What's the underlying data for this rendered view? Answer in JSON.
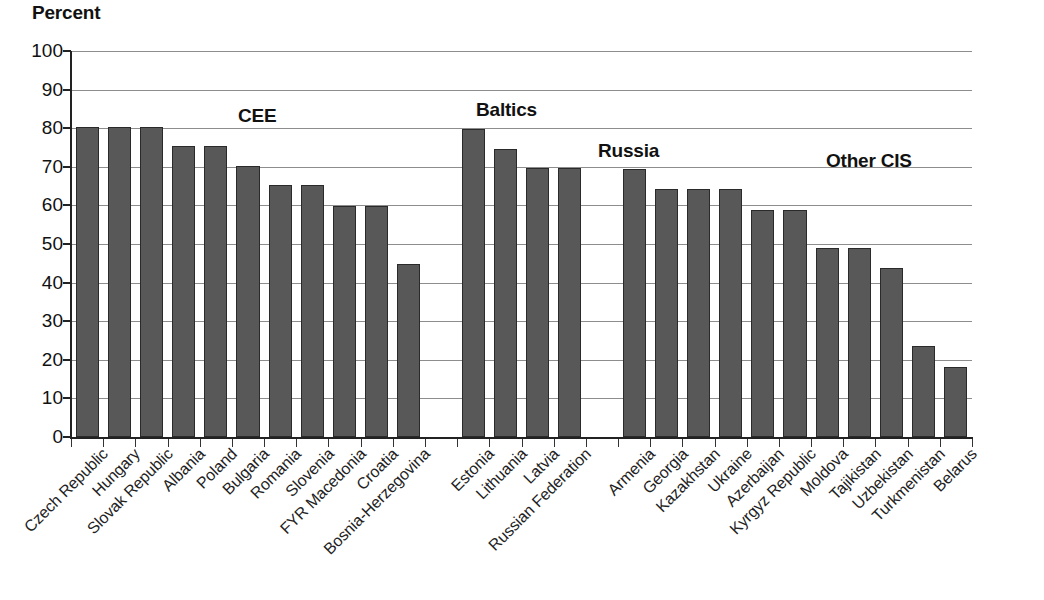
{
  "chart_data": {
    "type": "bar",
    "title": "",
    "ylabel": "Percent",
    "xlabel": "",
    "ylim": [
      0,
      100
    ],
    "ytick_step": 10,
    "yticks": [
      0,
      10,
      20,
      30,
      40,
      50,
      60,
      70,
      80,
      90,
      100
    ],
    "grid": true,
    "legend": "none",
    "bar_color": "#585858",
    "bar_edge_color": "#2a2a2a",
    "gridline_color": "#8d8d8d",
    "axis_color": "#222222",
    "categories": [
      "Czech Republic",
      "Hungary",
      "Slovak Republic",
      "Albania",
      "Poland",
      "Bulgaria",
      "Romania",
      "Slovenia",
      "FYR Macedonia",
      "Croatia",
      "Bosnia-Herzegovina",
      "Estonia",
      "Lithuania",
      "Latvia",
      "Russian Federation",
      "Armenia",
      "Georgia",
      "Kazakhstan",
      "Ukraine",
      "Azerbaijan",
      "Kyrgyz Republic",
      "Moldova",
      "Tajikistan",
      "Uzbekistan",
      "Turkmenistan",
      "Belarus"
    ],
    "values": [
      80.4,
      80.4,
      80.4,
      75.4,
      75.4,
      70.3,
      65.3,
      65.3,
      59.8,
      59.8,
      44.9,
      79.9,
      74.7,
      69.7,
      69.6,
      69.4,
      64.3,
      64.3,
      64.3,
      58.8,
      58.8,
      49.0,
      49.0,
      43.7,
      23.5,
      18.2
    ],
    "groups": [
      {
        "label": "CEE",
        "start": 0,
        "end": 10
      },
      {
        "label": "Baltics",
        "start": 11,
        "end": 13
      },
      {
        "label": "Russia",
        "start": 14,
        "end": 14
      },
      {
        "label": "Other CIS",
        "start": 15,
        "end": 25
      }
    ],
    "group_label_positions": [
      {
        "label": "CEE",
        "x": 238,
        "y": 105
      },
      {
        "label": "Baltics",
        "x": 476,
        "y": 99
      },
      {
        "label": "Russia",
        "x": 598,
        "y": 140
      },
      {
        "label": "Other CIS",
        "x": 826,
        "y": 150
      }
    ],
    "gap_slots": [
      11,
      15
    ]
  }
}
